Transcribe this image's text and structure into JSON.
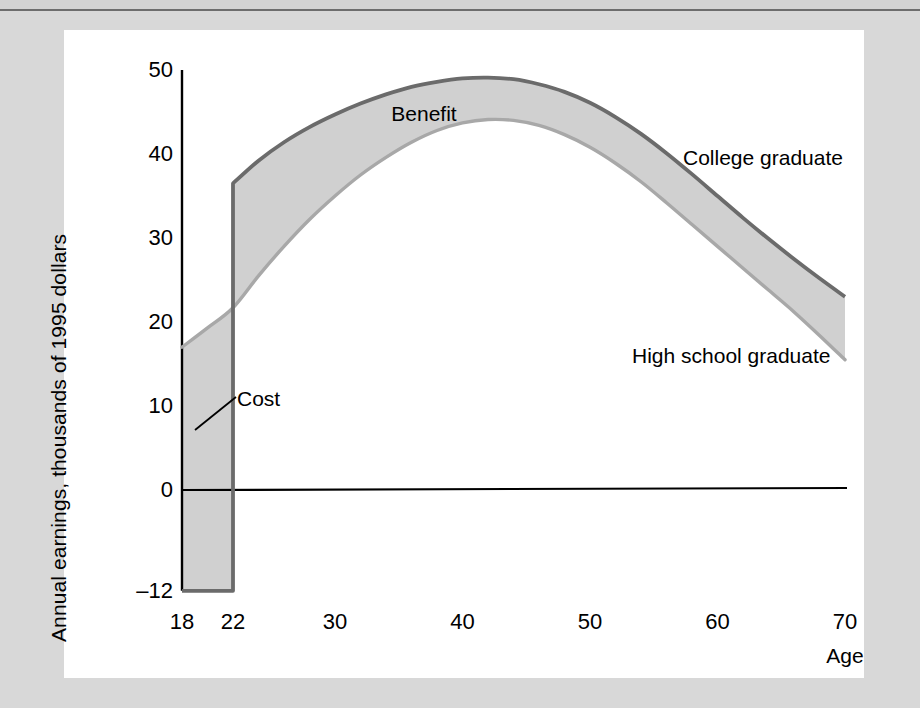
{
  "figure": {
    "background_color": "#d8d8d8",
    "card_color": "#ffffff",
    "band_fill_color": "#d0d0d0",
    "college_line_color": "#6b6b6b",
    "highschool_line_color": "#a8a8a8",
    "axis_color": "#000000"
  },
  "axes": {
    "y_title": "Annual earnings, thousands of 1995 dollars",
    "y_ticks": [
      "50",
      "40",
      "30",
      "20",
      "10",
      "0",
      "–12"
    ],
    "x_title": "Age",
    "x_ticks": [
      "18",
      "22",
      "30",
      "40",
      "50",
      "60",
      "70"
    ]
  },
  "annotations": {
    "benefit": "Benefit",
    "cost": "Cost",
    "college_series": "College graduate",
    "highschool_series": "High school graduate"
  },
  "chart_data": {
    "type": "area",
    "title": "",
    "subtitle": "",
    "xlabel": "Age",
    "ylabel": "Annual earnings, thousands of 1995 dollars",
    "xlim": [
      18,
      70
    ],
    "ylim": [
      -12,
      50
    ],
    "x_tick_values": [
      18,
      22,
      30,
      40,
      50,
      60,
      70
    ],
    "y_tick_values": [
      50,
      40,
      30,
      20,
      10,
      0,
      -12
    ],
    "grid": false,
    "legend_position": "inline-annotations",
    "zero_line": 0,
    "annotations": [
      {
        "text": "Benefit",
        "x": 37,
        "y": 45.5,
        "note": "labels shaded band between the two earnings curves after age 22"
      },
      {
        "text": "Cost",
        "x": 26,
        "y": 10,
        "note": "labels shaded region between age 18 and 22, forgone earnings plus tuition"
      },
      {
        "text": "College graduate",
        "x": 58,
        "y": 40,
        "note": "upper curve label"
      },
      {
        "text": "High school graduate",
        "x": 56,
        "y": 18,
        "note": "lower curve label"
      }
    ],
    "series": [
      {
        "name": "College graduate",
        "color": "#6b6b6b",
        "x": [
          18,
          19,
          20,
          21,
          22,
          22,
          24,
          26,
          28,
          30,
          32,
          34,
          36,
          38,
          40,
          42,
          44,
          46,
          48,
          50,
          52,
          54,
          56,
          58,
          60,
          62,
          64,
          66,
          68,
          70
        ],
        "values": [
          -12,
          -12,
          -12,
          -12,
          -12,
          36.5,
          39.2,
          41.4,
          43.2,
          44.7,
          46.0,
          47.1,
          48.0,
          48.6,
          49.0,
          49.1,
          48.9,
          48.3,
          47.4,
          46.1,
          44.4,
          42.4,
          40.1,
          37.6,
          35.0,
          32.4,
          29.9,
          27.5,
          25.2,
          23.0
        ]
      },
      {
        "name": "High school graduate",
        "color": "#a8a8a8",
        "x": [
          18,
          20,
          22,
          24,
          26,
          28,
          30,
          32,
          34,
          36,
          38,
          40,
          42,
          44,
          46,
          48,
          50,
          52,
          54,
          56,
          58,
          60,
          62,
          64,
          66,
          68,
          70
        ],
        "values": [
          17.0,
          19.3,
          21.7,
          25.5,
          29.0,
          32.2,
          35.0,
          37.5,
          39.6,
          41.4,
          42.8,
          43.7,
          44.1,
          44.0,
          43.4,
          42.3,
          40.8,
          38.9,
          36.7,
          34.2,
          31.6,
          29.0,
          26.4,
          23.8,
          21.2,
          18.4,
          15.5
        ]
      }
    ]
  }
}
